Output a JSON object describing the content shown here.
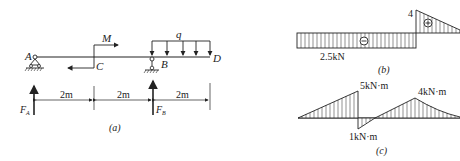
{
  "figure_a": {
    "caption": "(a)",
    "points": {
      "A": "A",
      "B": "B",
      "C": "C",
      "D": "D"
    },
    "moment_label": "M",
    "load_label": "q",
    "reaction_A": "F",
    "reaction_A_sub": "A",
    "reaction_B": "F",
    "reaction_B_sub": "B",
    "dimensions": [
      "2m",
      "2m",
      "2m"
    ]
  },
  "figure_b": {
    "caption": "(b)",
    "negative_value": "2.5kN",
    "positive_value": "4",
    "negative_sign": "−",
    "positive_sign": "+"
  },
  "figure_c": {
    "caption": "(c)",
    "peak_1": "5kN·m",
    "min_value": "1kN·m",
    "peak_2": "4kN·m"
  },
  "colors": {
    "line": "#222222",
    "background": "#ffffff"
  }
}
